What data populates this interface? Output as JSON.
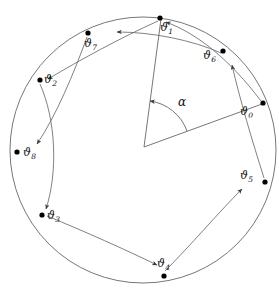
{
  "figure": {
    "kind": "geometric-diagram",
    "stroke_color": "#555555",
    "dot_color": "#000000",
    "label_color": "#111111",
    "background": "#ffffff"
  },
  "circle": {
    "center_x": 143,
    "center_y": 150,
    "radius": 133
  },
  "angle": {
    "symbol": "α",
    "vertex_x": 144,
    "vertex_y": 147,
    "arc_radius": 46
  },
  "points": [
    {
      "id": "t0",
      "glyph": "ϑ",
      "subscript": "0",
      "x": 263,
      "y": 103,
      "label_x": 240,
      "label_y": 106
    },
    {
      "id": "t1",
      "glyph": "ϑ",
      "subscript": "1",
      "x": 160,
      "y": 18,
      "label_x": 160,
      "label_y": 22
    },
    {
      "id": "t2",
      "glyph": "ϑ",
      "subscript": "2",
      "x": 40,
      "y": 80,
      "label_x": 42,
      "label_y": 76
    },
    {
      "id": "t3",
      "glyph": "ϑ",
      "subscript": "3",
      "x": 42,
      "y": 215,
      "label_x": 46,
      "label_y": 211
    },
    {
      "id": "t4",
      "glyph": "ϑ",
      "subscript": "4",
      "x": 164,
      "y": 276,
      "label_x": 156,
      "label_y": 258
    },
    {
      "id": "t5",
      "glyph": "ϑ",
      "subscript": "5",
      "x": 265,
      "y": 182,
      "label_x": 239,
      "label_y": 170
    },
    {
      "id": "t6",
      "glyph": "ϑ",
      "subscript": "6",
      "x": 223,
      "y": 51,
      "label_x": 203,
      "label_y": 52
    },
    {
      "id": "t7",
      "glyph": "ϑ",
      "subscript": "7",
      "x": 88,
      "y": 33,
      "label_x": 84,
      "label_y": 38
    },
    {
      "id": "t8",
      "glyph": "ϑ",
      "subscript": "8",
      "x": 17,
      "y": 152,
      "label_x": 22,
      "label_y": 148
    }
  ],
  "arrows": [
    {
      "name": "arc-t0-to-t1",
      "from": "t0",
      "to": "t1"
    },
    {
      "name": "arc-t1-to-t2",
      "from": "t1",
      "to": "t2"
    },
    {
      "name": "arc-t2-to-t3",
      "from": "t2",
      "to": "t3"
    },
    {
      "name": "arc-t3-to-t4",
      "from": "t3",
      "to": "t4"
    },
    {
      "name": "arc-t4-to-t5",
      "from": "t4",
      "to": "t5"
    },
    {
      "name": "arc-t5-to-t6",
      "from": "t5",
      "to": "t6"
    },
    {
      "name": "arc-t6-to-t7",
      "from": "t6",
      "to": "t7"
    },
    {
      "name": "arc-t7-to-t8",
      "from": "t7",
      "to": "t8"
    }
  ]
}
